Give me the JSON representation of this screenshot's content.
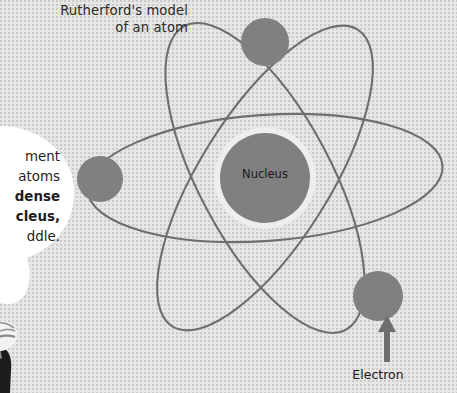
{
  "page": {
    "title": "Rutherford's model of an atom",
    "background_color": "#e6e6e4",
    "width": 457,
    "height": 393
  },
  "heading": {
    "text": "Rutherford's model\nof an atom"
  },
  "speech_bubble": {
    "note": "text is clipped by the left edge of the screenshot; only the visible fragments are recorded",
    "lines": [
      {
        "text": "ment",
        "bold": false
      },
      {
        "text": "atoms",
        "bold": false
      },
      {
        "text": "dense",
        "bold": true
      },
      {
        "text": "cleus,",
        "bold": true
      },
      {
        "text": "ddle.",
        "bold": false
      }
    ],
    "background_color": "#ffffff",
    "text_color": "#1d1d1d"
  },
  "figure": {
    "name": "scientist-character",
    "hair_color": "#f2f2f2",
    "suit_color": "#1c1c1c"
  },
  "diagram": {
    "type": "atom-model",
    "center": {
      "x": 265,
      "y": 178
    },
    "nucleus": {
      "label": "Nucleus",
      "cx": 265,
      "cy": 178,
      "r": 45,
      "fill": "#838383",
      "halo_color": "#eeeeec",
      "halo_r": 51
    },
    "orbit_color": "#6e6e6e",
    "orbit_width": 2.1,
    "orbits": [
      {
        "name": "orbit-horizontal",
        "rx": 178,
        "ry": 63,
        "rotation": -4
      },
      {
        "name": "orbit-left-tilt",
        "rx": 172,
        "ry": 66,
        "rotation": 62
      },
      {
        "name": "orbit-right-tilt",
        "rx": 175,
        "ry": 65,
        "rotation": -58
      }
    ],
    "electrons": [
      {
        "name": "electron-top",
        "cx": 265,
        "cy": 42,
        "r": 24,
        "fill": "#838383"
      },
      {
        "name": "electron-left",
        "cx": 100,
        "cy": 179,
        "r": 23,
        "fill": "#838383"
      },
      {
        "name": "electron-bottom-right",
        "cx": 378,
        "cy": 296,
        "r": 25,
        "fill": "#838383"
      }
    ],
    "annotations": [
      {
        "name": "electron-callout",
        "label": "Electron",
        "arrow": {
          "from_x": 387,
          "from_y": 362,
          "to_x": 387,
          "to_y": 318
        },
        "arrow_color": "#6e6e6e"
      }
    ]
  }
}
